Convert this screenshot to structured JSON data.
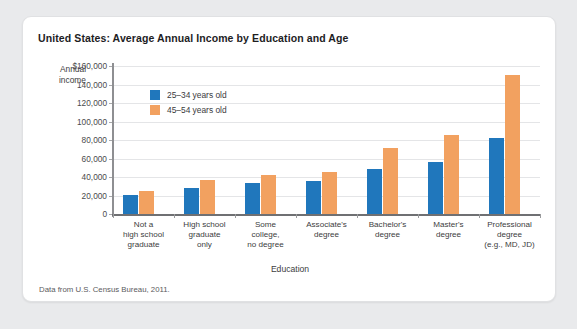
{
  "card": {
    "title": "United States: Average Annual Income by Education and Age",
    "source_note": "Data from U.S. Census Bureau, 2011."
  },
  "chart_data": {
    "type": "bar",
    "title": "United States: Average Annual Income by Education and Age",
    "xlabel": "Education",
    "ylabel": "Annual income",
    "ylim": [
      0,
      160000
    ],
    "ytick_labels": [
      "$160,000",
      "140,000",
      "120,000",
      "100,000",
      "80,000",
      "60,000",
      "40,000",
      "20,000",
      "0"
    ],
    "ytick_values": [
      160000,
      140000,
      120000,
      100000,
      80000,
      60000,
      40000,
      20000,
      0
    ],
    "grid": true,
    "legend_position": "upper-left-inside",
    "categories": [
      "Not a high school graduate",
      "High school graduate only",
      "Some college, no degree",
      "Associate's degree",
      "Bachelor's degree",
      "Master's degree",
      "Professional degree (e.g., MD, JD)"
    ],
    "category_lines": [
      [
        "Not a",
        "high school",
        "graduate"
      ],
      [
        "High school",
        "graduate",
        "only"
      ],
      [
        "Some",
        "college,",
        "no degree"
      ],
      [
        "Associate's",
        "degree"
      ],
      [
        "Bachelor's",
        "degree"
      ],
      [
        "Master's",
        "degree"
      ],
      [
        "Professional",
        "degree",
        "(e.g., MD, JD)"
      ]
    ],
    "series": [
      {
        "name": "25–34 years old",
        "color": "#2077bc",
        "values": [
          21000,
          28000,
          33000,
          36000,
          49000,
          56000,
          82000
        ]
      },
      {
        "name": "45–54 years old",
        "color": "#f2a160",
        "values": [
          25000,
          37000,
          42000,
          45000,
          71000,
          85000,
          150000
        ]
      }
    ]
  }
}
